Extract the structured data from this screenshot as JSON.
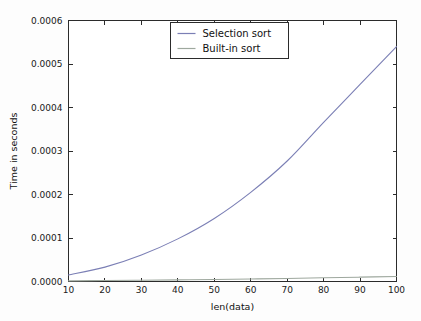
{
  "chart_data": {
    "type": "line",
    "title": "",
    "xlabel": "len(data)",
    "ylabel": "Time in seconds",
    "xlim": [
      10,
      100
    ],
    "ylim": [
      0.0,
      0.0006
    ],
    "grid": false,
    "legend_position": "top-center",
    "x": [
      10,
      20,
      30,
      40,
      50,
      60,
      70,
      80,
      90,
      100
    ],
    "xticks": [
      "10",
      "20",
      "30",
      "40",
      "50",
      "60",
      "70",
      "80",
      "90",
      "100"
    ],
    "yticks": [
      "0.0000",
      "0.0001",
      "0.0002",
      "0.0003",
      "0.0004",
      "0.0005",
      "0.0006"
    ],
    "ytick_values": [
      0.0,
      0.0001,
      0.0002,
      0.0003,
      0.0004,
      0.0005,
      0.0006
    ],
    "series": [
      {
        "name": "Selection sort",
        "color": "#7b7fb5",
        "values": [
          1.5e-05,
          3.3e-05,
          6.1e-05,
          9.8e-05,
          0.000145,
          0.000205,
          0.000277,
          0.000366,
          0.000453,
          0.00054
        ]
      },
      {
        "name": "Built-in sort",
        "color": "#9ea89e",
        "values": [
          1.5e-06,
          2.2e-06,
          3e-06,
          3.8e-06,
          4.7e-06,
          5.8e-06,
          7e-06,
          8.5e-06,
          1e-05,
          1.15e-05
        ]
      }
    ]
  },
  "legend": {
    "entries": [
      {
        "label": "Selection sort"
      },
      {
        "label": "Built-in sort"
      }
    ]
  },
  "axes": {
    "x_title": "len(data)",
    "y_title": "Time in seconds"
  }
}
